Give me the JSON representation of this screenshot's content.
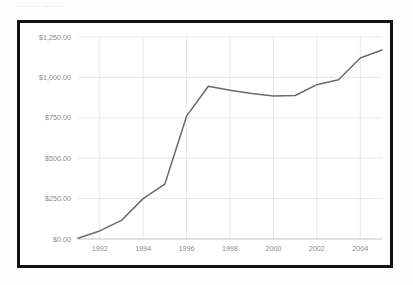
{
  "top_fragment": {
    "text": "— —— ———"
  },
  "colors": {
    "frame_border": "#111111",
    "plot_background": "#ffffff",
    "page_background": "#fdfdfd",
    "gridline": "#dcdcdc",
    "axis_line": "#b4b4b4",
    "tick_label": "#8a8a8a",
    "series_line": "#6a6a6a"
  },
  "chart_data": {
    "type": "line",
    "title": "",
    "subtitle": "",
    "xlabel": "",
    "ylabel": "",
    "x": [
      1991,
      1992,
      1993,
      1994,
      1995,
      1996,
      1997,
      1998,
      1999,
      2000,
      2001,
      2002,
      2003,
      2004,
      2005
    ],
    "series": [
      {
        "name": "",
        "values": [
          5,
          50,
          115,
          250,
          340,
          760,
          945,
          920,
          900,
          885,
          888,
          955,
          985,
          1120,
          1170
        ]
      }
    ],
    "xlim": [
      1991,
      2005
    ],
    "ylim": [
      0,
      1250
    ],
    "xticks": [
      1992,
      1994,
      1996,
      1998,
      2000,
      2002,
      2004
    ],
    "xticklabels": [
      "1992",
      "1994",
      "1996",
      "1998",
      "2000",
      "2002",
      "2004"
    ],
    "yticks": [
      0,
      250,
      500,
      750,
      1000,
      1250
    ],
    "yticklabels": [
      "$0.00",
      "$250.00",
      "$500.00",
      "$750.00",
      "$1,000.00",
      "$1,250.00"
    ],
    "grid": {
      "horizontal": true,
      "vertical": true
    },
    "legend": {
      "visible": false,
      "position": "none"
    },
    "annotations": []
  }
}
